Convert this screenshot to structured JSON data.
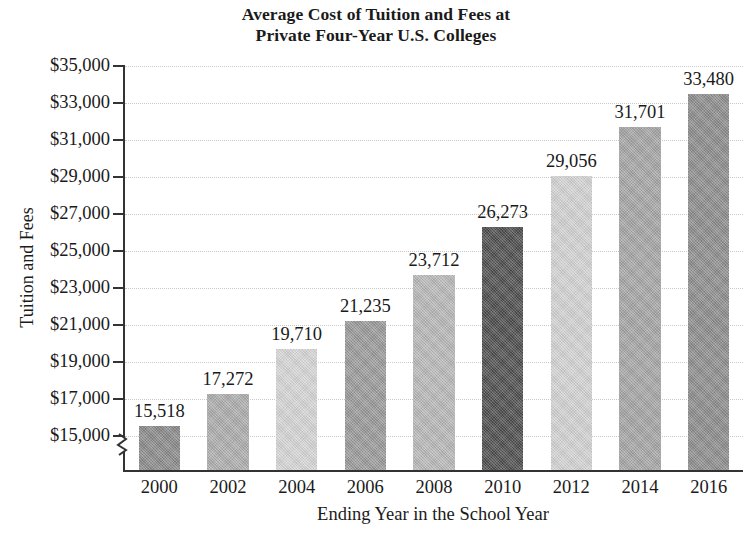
{
  "chart_data": {
    "type": "bar",
    "title": "Average Cost of Tuition and Fees at Private Four-Year U.S. Colleges",
    "title_lines": [
      "Average Cost of Tuition and Fees at",
      "Private Four-Year U.S. Colleges"
    ],
    "xlabel": "Ending Year in the School Year",
    "ylabel": "Tuition and Fees",
    "categories": [
      "2000",
      "2002",
      "2004",
      "2006",
      "2008",
      "2010",
      "2012",
      "2014",
      "2016"
    ],
    "values": [
      15518,
      17272,
      19710,
      21235,
      23712,
      26273,
      29056,
      31701,
      33480
    ],
    "value_labels": [
      "15,518",
      "17,272",
      "19,710",
      "21,235",
      "23,712",
      "26,273",
      "29,056",
      "31,701",
      "33,480"
    ],
    "bar_colors": [
      "#8a8a8a",
      "#adadad",
      "#d5d5d5",
      "#9a9a9a",
      "#b8b8b8",
      "#4e4e4e",
      "#d2d2d2",
      "#a5a5a5",
      "#8d8d8d"
    ],
    "ylim": [
      15000,
      35000
    ],
    "ytick_labels": [
      "$35,000",
      "$33,000",
      "$31,000",
      "$29,000",
      "$27,000",
      "$25,000",
      "$23,000",
      "$21,000",
      "$19,000",
      "$17,000",
      "$15,000"
    ],
    "ytick_values": [
      35000,
      33000,
      31000,
      29000,
      27000,
      25000,
      23000,
      21000,
      19000,
      17000,
      15000
    ],
    "ytick_step": 2000,
    "axis_break": true,
    "axis_break_note": "y-axis broken below $15,000",
    "grid": "horizontal-dotted",
    "gridline_color": "#c9c9c9",
    "axis_color": "#333333",
    "legend": "none",
    "background": "#ffffff"
  }
}
